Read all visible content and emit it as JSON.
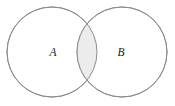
{
  "figure": {
    "background_color": "#ffffff",
    "width": 175,
    "height": 106
  },
  "chart_data": {
    "type": "diagram",
    "diagram_type": "venn-2-set",
    "title": "",
    "shaded_region": "intersection",
    "shaded_region_label": "A ∩ B",
    "sets": [
      {
        "id": "A",
        "label": "A",
        "label_x": 53,
        "label_y": 53,
        "center_x": 52,
        "center_y": 52,
        "radius": 45,
        "fill": "#ffffff",
        "stroke": "#8c8c8c"
      },
      {
        "id": "B",
        "label": "B",
        "label_x": 121,
        "label_y": 53,
        "center_x": 122,
        "center_y": 52,
        "radius": 45,
        "fill": "#ffffff",
        "stroke": "#8c8c8c"
      }
    ],
    "intersection": {
      "fill": "#ececec",
      "stroke": "#8c8c8c",
      "top_crossing": [
        87,
        13
      ],
      "bottom_crossing": [
        87,
        88
      ],
      "left_extent": 78,
      "right_extent": 96
    },
    "colors": {
      "outline": "#8c8c8c",
      "shade": "#ececec",
      "background": "#ffffff",
      "label": "#1a1a1a"
    }
  }
}
